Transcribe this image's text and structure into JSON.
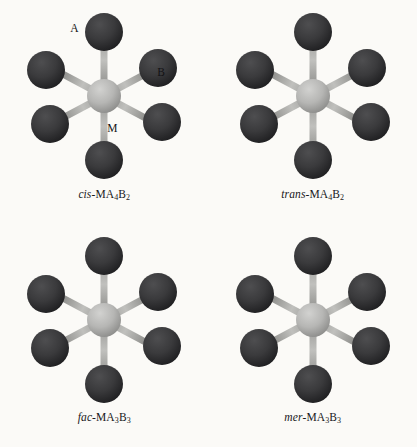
{
  "figure": {
    "background_color": "#fbfaf7",
    "ligand_color": "#3a3a3c",
    "ligand_color_dark": "#232325",
    "metal_color": "#b9b9b7",
    "metal_color_dark": "#8c8c8a",
    "bond_color": "#a9a9a6",
    "bond_color_dark": "#6f6f6d",
    "geometry": "octahedral",
    "structure_count": 4
  },
  "structures": [
    {
      "id": "cis-ma4b2",
      "prefix": "cis",
      "formula_core": "-MA",
      "a_count": "4",
      "b_letter": "B",
      "b_count": "2",
      "caption_plain": "cis-MA4B2",
      "labels": {
        "ligand_a": "A",
        "ligand_b": "B",
        "metal": "M"
      },
      "show_labels": true
    },
    {
      "id": "trans-ma4b2",
      "prefix": "trans",
      "formula_core": "-MA",
      "a_count": "4",
      "b_letter": "B",
      "b_count": "2",
      "caption_plain": "trans-MA4B2",
      "show_labels": false
    },
    {
      "id": "fac-ma3b3",
      "prefix": "fac",
      "formula_core": "-MA",
      "a_count": "3",
      "b_letter": "B",
      "b_count": "3",
      "caption_plain": "fac-MA3B3",
      "show_labels": false
    },
    {
      "id": "mer-ma3b3",
      "prefix": "mer",
      "formula_core": "-MA",
      "a_count": "3",
      "b_letter": "B",
      "b_count": "3",
      "caption_plain": "mer-MA3B3",
      "show_labels": false
    }
  ]
}
